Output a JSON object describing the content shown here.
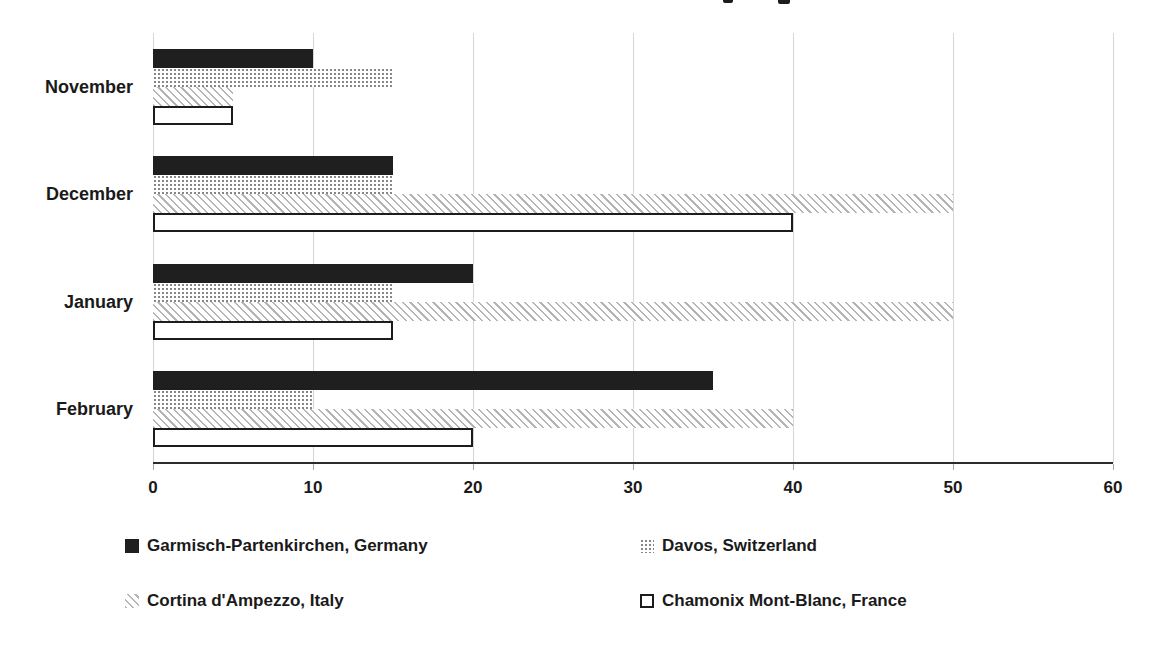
{
  "page": {
    "background": "#ffffff",
    "title_visible_text": ""
  },
  "chart_data": {
    "type": "bar",
    "orientation": "horizontal",
    "title": "",
    "xlabel": "",
    "ylabel": "",
    "categories": [
      "November",
      "December",
      "January",
      "February"
    ],
    "series": [
      {
        "name": "Garmisch-Partenkirchen, Germany",
        "pattern": "solid-black",
        "values": [
          10,
          15,
          20,
          35
        ]
      },
      {
        "name": "Davos, Switzerland",
        "pattern": "dotted-gray",
        "values": [
          15,
          15,
          15,
          10
        ]
      },
      {
        "name": "Cortina d'Ampezzo, Italy",
        "pattern": "diagonal-hatch",
        "values": [
          5,
          50,
          50,
          40
        ]
      },
      {
        "name": "Chamonix Mont-Blanc, France",
        "pattern": "white-outline",
        "values": [
          5,
          40,
          15,
          20
        ]
      }
    ],
    "xlim": [
      0,
      60
    ],
    "x_ticks": [
      0,
      10,
      20,
      30,
      40,
      50,
      60
    ],
    "grid": true,
    "legend_position": "bottom",
    "colors": {
      "bar_solid": "#1f1f1f",
      "pattern_gray": "#9a9a9a",
      "gridline": "#d6d6d6",
      "axis_line": "#2b2b2b",
      "text": "#1a1a1a"
    }
  }
}
